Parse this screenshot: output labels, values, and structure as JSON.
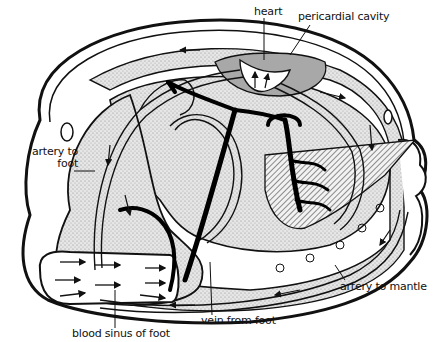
{
  "diagram": {
    "type": "anatomical circulatory diagram (bivalve / clam)",
    "colors": {
      "ink": "#111111",
      "stipple": "#d4d4d4",
      "stipple_dark": "#bdbdbd",
      "pericardial": "#9e9e9e",
      "paper": "#ffffff"
    },
    "labels": {
      "heart": "heart",
      "pericardial_cavity": "pericardial cavity",
      "artery_to_foot": "artery to\nfoot",
      "artery_to_mantle": "artery to mantle",
      "vein_from_foot": "vein from foot",
      "blood_sinus_of_foot": "blood sinus of foot"
    }
  }
}
